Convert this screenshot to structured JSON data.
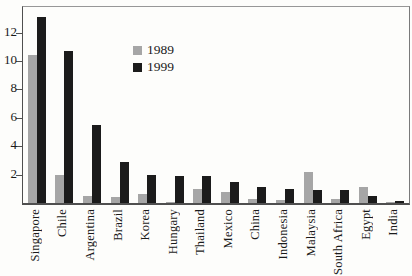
{
  "figure": {
    "background_color": "#fdfdfb",
    "text_color": "#1a1a1a",
    "axis_color": "#4f4f4f"
  },
  "chart_data": {
    "type": "bar",
    "title": "",
    "xlabel": "",
    "ylabel": "",
    "categories": [
      "Singapore",
      "Chile",
      "Argentina",
      "Brazil",
      "Korea",
      "Hungary",
      "Thailand",
      "Mexico",
      "China",
      "Indonesia",
      "Malaysia",
      "South Africa",
      "Egypt",
      "India"
    ],
    "series": [
      {
        "name": "1989",
        "color": "#a6a6a6",
        "values": [
          10.4,
          2.0,
          0.5,
          0.4,
          0.6,
          0.1,
          1.0,
          0.8,
          0.3,
          0.2,
          2.2,
          0.3,
          1.1,
          0.05
        ]
      },
      {
        "name": "1999",
        "color": "#1b1b1b",
        "values": [
          13.1,
          10.7,
          5.5,
          2.9,
          2.0,
          1.9,
          1.9,
          1.5,
          1.1,
          1.0,
          0.9,
          0.95,
          0.5,
          0.15
        ]
      }
    ],
    "ylim": [
      0,
      13.8
    ],
    "yticks": [
      2,
      4,
      6,
      8,
      10,
      12
    ],
    "grid": false,
    "legend_position": "inside-upper-center-left",
    "x_label_rotation": "vertical-bottom-to-top"
  }
}
